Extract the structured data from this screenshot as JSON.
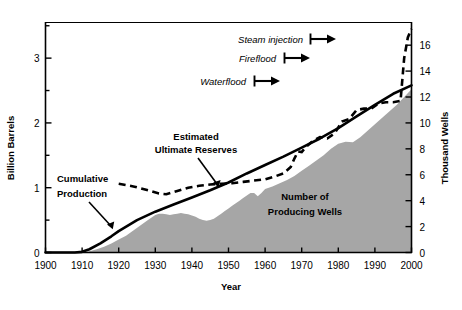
{
  "chart_data": {
    "type": "area",
    "title": "",
    "xlabel": "Year",
    "ylabel": "Billion Barrels",
    "y2label": "Thousand Wells",
    "xlim": [
      1900,
      2000
    ],
    "ylim": [
      0,
      3.55
    ],
    "y2lim": [
      0,
      17.75
    ],
    "grid": false,
    "legend_position": "inline-annotations",
    "xticks": [
      1900,
      1910,
      1920,
      1930,
      1940,
      1950,
      1960,
      1970,
      1980,
      1990,
      2000
    ],
    "xtick_labels": [
      "1900",
      "1910",
      "1920",
      "1930",
      "1940",
      "1950",
      "1960",
      "1970",
      "1980",
      "1990",
      "2000"
    ],
    "yticks": [
      0,
      0.5,
      1,
      1.5,
      2,
      2.5,
      3,
      3.5
    ],
    "ytick_labels": [
      "0",
      "",
      "1",
      "",
      "2",
      "",
      "3",
      ""
    ],
    "y2ticks": [
      0,
      2,
      4,
      6,
      8,
      10,
      12,
      14,
      16
    ],
    "y2tick_labels": [
      "0",
      "2",
      "4",
      "6",
      "8",
      "10",
      "12",
      "14",
      "16"
    ],
    "series": [
      {
        "name": "Number of Producing Wells",
        "type": "area",
        "axis": "right",
        "color": "#a6a6a6",
        "units": "Thousand Wells",
        "x": [
          1900,
          1905,
          1910,
          1912,
          1914,
          1916,
          1918,
          1920,
          1922,
          1924,
          1926,
          1928,
          1930,
          1931,
          1932,
          1933,
          1934,
          1935,
          1936,
          1937,
          1938,
          1939,
          1940,
          1941,
          1942,
          1943,
          1944,
          1945,
          1946,
          1947,
          1948,
          1949,
          1950,
          1951,
          1952,
          1953,
          1954,
          1955,
          1956,
          1957,
          1958,
          1959,
          1960,
          1962,
          1964,
          1966,
          1968,
          1970,
          1972,
          1974,
          1976,
          1978,
          1980,
          1982,
          1984,
          1986,
          1988,
          1990,
          1992,
          1994,
          1996,
          1998,
          2000
        ],
        "y": [
          0,
          0,
          0,
          0.1,
          0.25,
          0.45,
          0.7,
          1.0,
          1.3,
          1.7,
          2.1,
          2.5,
          2.9,
          3.0,
          3.0,
          2.95,
          2.9,
          2.95,
          3.0,
          3.05,
          3.0,
          2.95,
          2.85,
          2.75,
          2.6,
          2.5,
          2.45,
          2.5,
          2.6,
          2.8,
          3.0,
          3.2,
          3.4,
          3.6,
          3.8,
          4.0,
          4.2,
          4.4,
          4.6,
          4.6,
          4.35,
          4.6,
          4.9,
          5.1,
          5.35,
          5.6,
          5.9,
          6.3,
          6.7,
          7.1,
          7.5,
          8.0,
          8.4,
          8.55,
          8.5,
          8.9,
          9.4,
          9.9,
          10.4,
          10.9,
          11.4,
          12.0,
          12.6
        ]
      },
      {
        "name": "Cumulative Production",
        "type": "line",
        "style": "solid",
        "axis": "left",
        "color": "#000000",
        "units": "Billion Barrels",
        "x": [
          1900,
          1905,
          1908,
          1910,
          1912,
          1915,
          1918,
          1920,
          1925,
          1930,
          1935,
          1940,
          1945,
          1950,
          1955,
          1960,
          1965,
          1970,
          1975,
          1980,
          1985,
          1990,
          1995,
          2000
        ],
        "y": [
          0.0,
          0.0,
          0.0,
          0.01,
          0.05,
          0.14,
          0.25,
          0.33,
          0.5,
          0.63,
          0.74,
          0.85,
          0.96,
          1.08,
          1.22,
          1.35,
          1.48,
          1.62,
          1.76,
          1.92,
          2.1,
          2.28,
          2.45,
          2.58
        ]
      },
      {
        "name": "Estimated Ultimate Reserves",
        "type": "line",
        "style": "dashed",
        "axis": "left",
        "color": "#000000",
        "units": "Billion Barrels",
        "x": [
          1920,
          1924,
          1928,
          1931,
          1933,
          1936,
          1939,
          1942,
          1945,
          1948,
          1951,
          1954,
          1957,
          1960,
          1963,
          1965,
          1967,
          1968,
          1969,
          1970,
          1971,
          1973,
          1975,
          1977,
          1979,
          1981,
          1983,
          1985,
          1987,
          1989,
          1991,
          1993,
          1995,
          1997,
          1998,
          1999,
          2000
        ],
        "y": [
          1.06,
          1.02,
          0.96,
          0.91,
          0.9,
          0.95,
          1.0,
          1.03,
          1.05,
          1.06,
          1.07,
          1.09,
          1.11,
          1.13,
          1.18,
          1.22,
          1.32,
          1.45,
          1.56,
          1.55,
          1.62,
          1.72,
          1.78,
          1.76,
          1.84,
          2.02,
          2.06,
          2.2,
          2.22,
          2.22,
          2.3,
          2.32,
          2.32,
          2.34,
          3.0,
          3.32,
          3.45
        ]
      }
    ],
    "annotations": [
      {
        "name": "estimated-ultimate-reserves-label",
        "text_line1": "Estimated",
        "text_line2": "Ultimate Reserves",
        "style": "bold",
        "arrow": true
      },
      {
        "name": "cumulative-production-label",
        "text_line1": "Cumulative",
        "text_line2": "Production",
        "style": "bold",
        "arrow": true
      },
      {
        "name": "number-of-producing-wells-label",
        "text_line1": "Number of",
        "text_line2": "Producing Wells",
        "style": "bold",
        "arrow": false
      }
    ],
    "process_markers": [
      {
        "name": "steam-injection",
        "label": "Steam injection",
        "start_year": 1964,
        "arrow": "right"
      },
      {
        "name": "fireflood",
        "label": "Fireflood",
        "start_year": 1957,
        "arrow": "right"
      },
      {
        "name": "waterflood",
        "label": "Waterflood",
        "start_year": 1950,
        "arrow": "right"
      }
    ]
  },
  "axes": {
    "left_title": "Billion Barrels",
    "right_title": "Thousand Wells",
    "x_title": "Year"
  },
  "labels": {
    "estimated_line1": "Estimated",
    "estimated_line2": "Ultimate Reserves",
    "cumulative_line1": "Cumulative",
    "cumulative_line2": "Production",
    "wells_line1": "Number of",
    "wells_line2": "Producing Wells",
    "steam_injection": "Steam injection",
    "fireflood": "Fireflood",
    "waterflood": "Waterflood"
  },
  "xtick_labels": [
    "1900",
    "1910",
    "1920",
    "1930",
    "1940",
    "1950",
    "1960",
    "1970",
    "1980",
    "1990",
    "2000"
  ],
  "left_labels": [
    "3",
    "2",
    "1",
    "0"
  ],
  "right_labels": [
    "16",
    "14",
    "12",
    "10",
    "8",
    "6",
    "4",
    "2",
    "0"
  ],
  "colors": {
    "area_fill": "#a6a6a6",
    "line": "#000000",
    "axis": "#000000",
    "background": "#ffffff"
  }
}
